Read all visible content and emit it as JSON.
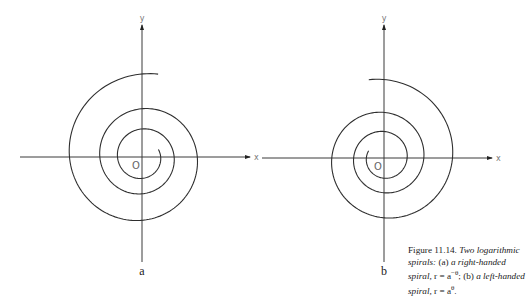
{
  "figure": {
    "panels": [
      {
        "id": "a",
        "label": "a",
        "origin_label": "O",
        "x_axis_label": "x",
        "y_axis_label": "y",
        "handedness": "right-handed",
        "equation": "r = a^-θ",
        "origin": [
          142,
          157
        ],
        "x_axis": [
          20,
          250
        ],
        "y_axis": [
          25,
          262
        ],
        "spiral": {
          "r_start": 18,
          "growth_per_turn": 1.72,
          "turns": 2.85,
          "direction": "clockwise-screen",
          "start_angle_deg": -25
        }
      },
      {
        "id": "b",
        "label": "b",
        "origin_label": "O",
        "x_axis_label": "x",
        "y_axis_label": "y",
        "handedness": "left-handed",
        "equation": "r = a^θ",
        "origin": [
          384,
          158
        ],
        "x_axis": [
          262,
          492
        ],
        "y_axis": [
          25,
          262
        ],
        "spiral": {
          "r_start": 17,
          "growth_per_turn": 1.72,
          "turns": 2.85,
          "direction": "counterclockwise-screen",
          "start_angle_deg": 205
        }
      }
    ],
    "caption": {
      "number": "Figure 11.14.",
      "title": "Two logarithmic spirals:",
      "part_a_label": "(a)",
      "part_a_text": "a right-handed spiral,",
      "part_a_eq": "r = a",
      "part_a_exp": "−θ",
      "sep": ";",
      "part_b_label": "(b)",
      "part_b_text": "a left-handed spiral,",
      "part_b_eq": "r = a",
      "part_b_exp": "θ",
      "end": "."
    }
  }
}
